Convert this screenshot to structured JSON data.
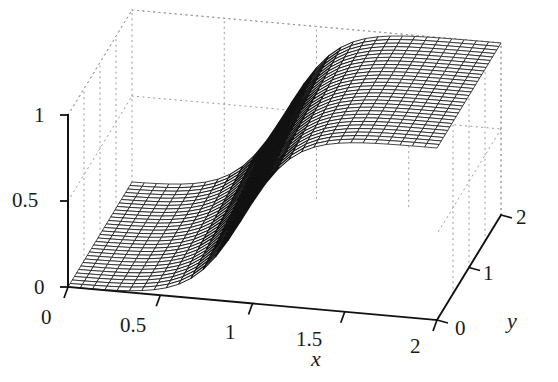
{
  "figure": {
    "kind": "3d-surface-plot",
    "background_color": "#ffffff",
    "line_color": "#111111",
    "grid_color": "#9a9a9a",
    "width": 558,
    "height": 382
  },
  "axes": {
    "x": {
      "name": "x",
      "ticks": [
        "0",
        "0.5",
        "1",
        "1.5",
        "2"
      ],
      "tick_values": [
        0,
        0.5,
        1,
        1.5,
        2
      ],
      "range": [
        0,
        2
      ]
    },
    "y": {
      "name": "y",
      "ticks": [
        "0",
        "1",
        "2"
      ],
      "tick_values": [
        0,
        1,
        2
      ],
      "range": [
        0,
        2
      ]
    },
    "z": {
      "name": "",
      "ticks": [
        "0",
        "0.5",
        "1"
      ],
      "tick_values": [
        0,
        0.5,
        1
      ],
      "range": [
        0,
        1
      ]
    }
  },
  "chart_data": {
    "type": "surface",
    "title": "",
    "xlabel": "x",
    "ylabel": "y",
    "zlabel": "",
    "xlim": [
      0,
      2
    ],
    "ylim": [
      0,
      2
    ],
    "zlim": [
      0,
      1
    ],
    "grid": true,
    "legend": false,
    "mesh": {
      "x_divisions": 30,
      "y_divisions": 30
    },
    "shading": "mesh-wireframe-white-faces",
    "x": [
      0,
      0.2,
      0.4,
      0.6,
      0.8,
      1,
      1.2,
      1.4,
      1.6,
      1.8,
      2
    ],
    "y": [
      0,
      0.4,
      0.8,
      1.2,
      1.6,
      2
    ],
    "z_rows": [
      {
        "y": 0,
        "values": [
          0.0,
          0.02,
          0.06,
          0.13,
          0.26,
          0.46,
          0.68,
          0.84,
          0.93,
          0.98,
          1.0
        ]
      },
      {
        "y": 0.4,
        "values": [
          0.0,
          0.02,
          0.07,
          0.15,
          0.29,
          0.5,
          0.71,
          0.86,
          0.94,
          0.98,
          1.0
        ]
      },
      {
        "y": 0.8,
        "values": [
          0.0,
          0.03,
          0.08,
          0.17,
          0.32,
          0.53,
          0.74,
          0.88,
          0.95,
          0.99,
          1.0
        ]
      },
      {
        "y": 1.2,
        "values": [
          0.0,
          0.03,
          0.09,
          0.19,
          0.35,
          0.56,
          0.76,
          0.89,
          0.96,
          0.99,
          1.0
        ]
      },
      {
        "y": 1.6,
        "values": [
          0.0,
          0.03,
          0.1,
          0.21,
          0.38,
          0.59,
          0.78,
          0.9,
          0.96,
          0.99,
          1.0
        ]
      },
      {
        "y": 2,
        "values": [
          0.0,
          0.04,
          0.11,
          0.23,
          0.41,
          0.61,
          0.79,
          0.91,
          0.97,
          0.99,
          1.0
        ]
      }
    ]
  },
  "labels": {
    "z_0": "0",
    "z_05": "0.5",
    "z_1": "1",
    "x_0": "0",
    "x_05": "0.5",
    "x_1": "1",
    "x_15": "1.5",
    "x_2": "2",
    "y_0": "0",
    "y_1": "1",
    "y_2": "2",
    "x_axis_name": "x",
    "y_axis_name": "y"
  }
}
